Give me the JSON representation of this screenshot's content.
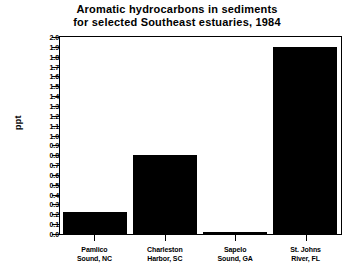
{
  "chart_data": {
    "type": "bar",
    "title": "Aromatic hydrocarbons in sediments for selected Southeast estuaries, 1984",
    "title_lines": [
      "Aromatic hydrocarbons in sediments",
      "for selected Southeast estuaries, 1984"
    ],
    "xlabel": "",
    "ylabel": "ppt",
    "categories": [
      "Pamlico Sound, NC",
      "Charleston Harbor, SC",
      "Sapelo Sound, GA",
      "St. Johns River, FL"
    ],
    "category_lines": [
      [
        "Pamlico",
        "Sound, NC"
      ],
      [
        "Charleston",
        "Harbor, SC"
      ],
      [
        "Sapelo",
        "Sound, GA"
      ],
      [
        "St. Johns",
        "River, FL"
      ]
    ],
    "values": [
      0.22,
      0.8,
      0.02,
      1.9
    ],
    "ylim": [
      0.0,
      2.0
    ],
    "ytick_step": 0.1,
    "ytick_labels": [
      "2.0",
      "1.9",
      "1.8",
      "1.7",
      "1.6",
      "1.5",
      "1.4",
      "1.3",
      "1.2",
      "1.1",
      "1.0",
      "0.9",
      "0.8",
      "0.7",
      "0.6",
      "0.5",
      "0.4",
      "0.3",
      "0.2",
      "0.1",
      "0.0"
    ],
    "ytick_values": [
      2.0,
      1.9,
      1.8,
      1.7,
      1.6,
      1.5,
      1.4,
      1.3,
      1.2,
      1.1,
      1.0,
      0.9,
      0.8,
      0.7,
      0.6,
      0.5,
      0.4,
      0.3,
      0.2,
      0.1,
      0.0
    ],
    "grid": false,
    "legend": false,
    "bar_color": "#000000",
    "background_color": "#ffffff",
    "axis_color": "#000000"
  }
}
